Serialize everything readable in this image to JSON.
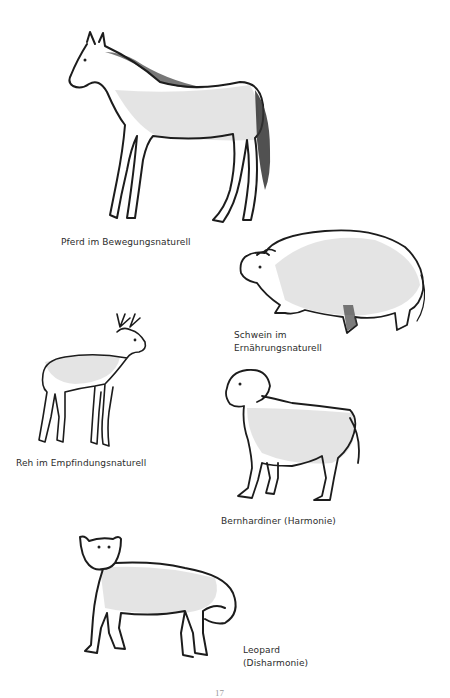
{
  "page": {
    "page_number": "17"
  },
  "figures": [
    {
      "id": "horse",
      "caption": "Pferd im Bewegungsnaturell",
      "icon": "horse-drawing-icon"
    },
    {
      "id": "pig",
      "caption_line1": "Schwein im",
      "caption_line2": "Ernährungsnaturell",
      "icon": "pig-drawing-icon"
    },
    {
      "id": "deer",
      "caption": "Reh im Empfindungsnaturell",
      "icon": "deer-drawing-icon"
    },
    {
      "id": "dog",
      "caption": "Bernhardiner (Harmonie)",
      "icon": "dog-drawing-icon"
    },
    {
      "id": "leopard",
      "caption_line1": "Leopard",
      "caption_line2": "(Disharmonie)",
      "icon": "leopard-drawing-icon"
    }
  ]
}
